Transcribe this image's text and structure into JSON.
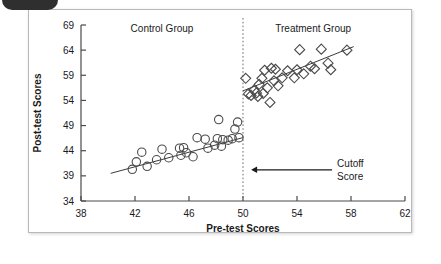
{
  "figure": {
    "background_color": "#ffffff",
    "border_color": "#b9b9b9",
    "badge_color": "#2f2f2f"
  },
  "chart_data": {
    "type": "scatter",
    "title": "",
    "xlabel": "Pre-test Scores",
    "ylabel": "Post-test Scores",
    "xlim": [
      38,
      62
    ],
    "ylim": [
      34,
      69
    ],
    "xticks": [
      38,
      42,
      46,
      50,
      54,
      58,
      62
    ],
    "yticks": [
      34,
      39,
      44,
      49,
      54,
      59,
      64,
      69
    ],
    "xtick_labels": [
      "38",
      "42",
      "46",
      "50",
      "54",
      "58",
      "62"
    ],
    "ytick_labels": [
      "34",
      "39",
      "44",
      "49",
      "54",
      "59",
      "64",
      "69"
    ],
    "grid": false,
    "legend": "none",
    "cutoff": {
      "x_value": 50,
      "label_line1": "Cutoff",
      "label_line2": "Score",
      "line_style": "dotted",
      "arrow_from_x": 56.6,
      "arrow_to_x": 50.6,
      "arrow_y": 40.2
    },
    "annotations": [
      {
        "text": "Control Group",
        "x": 44.0,
        "y": 67.6
      },
      {
        "text": "Treatment Group",
        "x": 55.2,
        "y": 67.6
      }
    ],
    "series": [
      {
        "name": "Control Group",
        "marker": "circle",
        "marker_color": "#4a4a4a",
        "points": [
          [
            41.8,
            40.3
          ],
          [
            42.1,
            41.8
          ],
          [
            42.5,
            43.7
          ],
          [
            42.9,
            40.9
          ],
          [
            43.6,
            42.2
          ],
          [
            44.0,
            44.3
          ],
          [
            44.5,
            42.6
          ],
          [
            45.3,
            44.5
          ],
          [
            45.4,
            43.1
          ],
          [
            45.6,
            44.6
          ],
          [
            45.8,
            43.6
          ],
          [
            46.3,
            42.8
          ],
          [
            46.6,
            46.6
          ],
          [
            47.2,
            46.3
          ],
          [
            47.4,
            44.5
          ],
          [
            47.9,
            45.1
          ],
          [
            48.1,
            46.4
          ],
          [
            48.2,
            50.2
          ],
          [
            48.4,
            44.9
          ],
          [
            48.5,
            46.2
          ],
          [
            48.9,
            46.1
          ],
          [
            49.2,
            46.4
          ],
          [
            49.4,
            48.3
          ],
          [
            49.6,
            49.7
          ],
          [
            49.7,
            46.6
          ]
        ],
        "fit_line": {
          "x1": 40.2,
          "y1": 39.5,
          "x2": 50.0,
          "y2": 46.6
        }
      },
      {
        "name": "Treatment Group",
        "marker": "diamond",
        "marker_color": "#4a4a4a",
        "points": [
          [
            50.2,
            58.4
          ],
          [
            50.4,
            55.3
          ],
          [
            50.6,
            55.0
          ],
          [
            50.8,
            56.0
          ],
          [
            51.0,
            55.5
          ],
          [
            51.1,
            54.8
          ],
          [
            51.2,
            57.2
          ],
          [
            51.4,
            58.4
          ],
          [
            51.5,
            55.4
          ],
          [
            51.6,
            60.0
          ],
          [
            51.8,
            56.5
          ],
          [
            52.0,
            53.6
          ],
          [
            52.1,
            60.4
          ],
          [
            52.3,
            57.9
          ],
          [
            52.4,
            60.2
          ],
          [
            52.6,
            56.9
          ],
          [
            52.9,
            58.5
          ],
          [
            53.3,
            59.9
          ],
          [
            53.8,
            58.5
          ],
          [
            54.0,
            60.1
          ],
          [
            54.2,
            64.1
          ],
          [
            54.5,
            59.3
          ],
          [
            55.0,
            60.8
          ],
          [
            55.3,
            60.3
          ],
          [
            55.8,
            64.2
          ],
          [
            56.3,
            61.4
          ],
          [
            56.5,
            60.1
          ],
          [
            57.7,
            64.0
          ]
        ],
        "fit_line": {
          "x1": 50.0,
          "y1": 55.9,
          "x2": 58.2,
          "y2": 64.7
        }
      }
    ]
  }
}
